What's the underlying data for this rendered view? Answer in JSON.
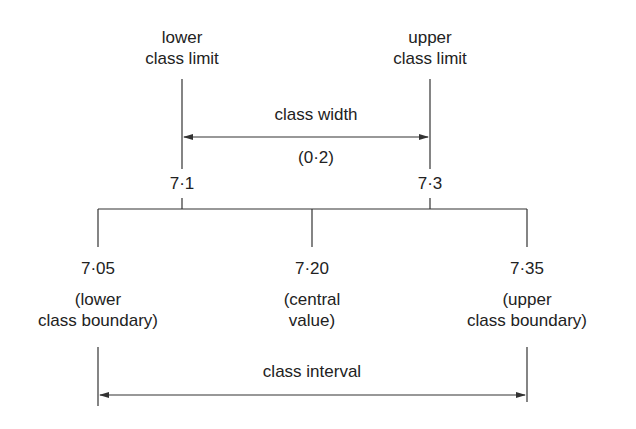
{
  "diagram": {
    "top_left_label": {
      "line1": "lower",
      "line2": "class limit"
    },
    "top_right_label": {
      "line1": "upper",
      "line2": "class limit"
    },
    "class_width_label": "class width",
    "class_width_value": "(0·2)",
    "lower_limit_value": "7·1",
    "upper_limit_value": "7·3",
    "lower_boundary": {
      "value": "7·05",
      "line1": "(lower",
      "line2": "class boundary)"
    },
    "central": {
      "value": "7·20",
      "line1": "(central",
      "line2": "value)"
    },
    "upper_boundary": {
      "value": "7·35",
      "line1": "(upper",
      "line2": "class boundary)"
    },
    "class_interval_label": "class interval",
    "line_color": "#333333"
  }
}
